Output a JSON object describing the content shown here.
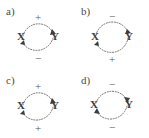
{
  "figure": {
    "background_color": "#ffffff",
    "arc_color": "#6f6f6f",
    "text_color": "#3d3d3d",
    "node_labels": {
      "source": "X",
      "target": "Y"
    }
  },
  "panels": [
    {
      "label": "a)",
      "node_left": "X",
      "node_right": "Y",
      "top_arc": {
        "sign": "+",
        "arrow_at": "Y"
      },
      "bottom_arc": {
        "sign": "−",
        "arrow_at": "X"
      }
    },
    {
      "label": "b)",
      "node_left": "X",
      "node_right": "Y",
      "top_arc": {
        "sign": "−",
        "arrow_at": "Y"
      },
      "bottom_arc": {
        "sign": "+",
        "arrow_at": "X"
      }
    },
    {
      "label": "c)",
      "node_left": "X",
      "node_right": "Y",
      "top_arc": {
        "sign": "+",
        "arrow_at": "Y"
      },
      "bottom_arc": {
        "sign": "+",
        "arrow_at": "X"
      }
    },
    {
      "label": "d)",
      "node_left": "X",
      "node_right": "Y",
      "top_arc": {
        "sign": "−",
        "arrow_at": "Y"
      },
      "bottom_arc": {
        "sign": "−",
        "arrow_at": "X"
      }
    }
  ]
}
